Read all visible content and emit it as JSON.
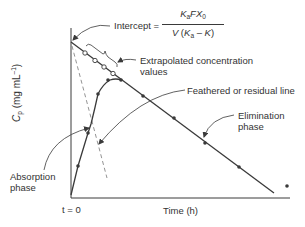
{
  "diagram": {
    "axes": {
      "y_label_symbol": "C",
      "y_label_subscript": "p",
      "y_label_units": "(mg mL",
      "y_label_units_sup": "–1",
      "y_label_units_close": ")",
      "x_label": "Time (h)",
      "origin_label": "t = 0"
    },
    "annotations": {
      "intercept_prefix": "Intercept =",
      "intercept_numerator": "KaFX0",
      "intercept_denominator": "V (Ka – K)",
      "extrapolated_line1": "Extrapolated concentration",
      "extrapolated_line2": "values",
      "feathered": "Feathered or residual line",
      "elimination_line1": "Elimination",
      "elimination_line2": "phase",
      "absorption_line1": "Absorption",
      "absorption_line2": "phase"
    },
    "colors": {
      "line": "#3a3a3a",
      "dashed": "#777777",
      "background": "#ffffff"
    },
    "series": {
      "observed_points": "filled circles on absorption curve and elimination line",
      "extrapolated_points": "open circles on back-extrapolated elimination line",
      "residual_line": "dashed"
    }
  }
}
